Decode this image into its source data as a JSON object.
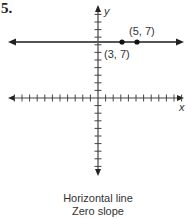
{
  "problem_number": "5.",
  "axes": {
    "x_label": "x",
    "y_label": "y",
    "origin_px": [
      98,
      98
    ],
    "unit_px": 7.6,
    "x_range": [
      -11,
      11
    ],
    "y_range": [
      -11,
      12
    ]
  },
  "line": {
    "type": "horizontal",
    "y_value": 7,
    "color": "#555555"
  },
  "points": [
    {
      "x": 3,
      "y": 7,
      "label": "(3, 7)"
    },
    {
      "x": 5,
      "y": 7,
      "label": "(5, 7)"
    }
  ],
  "caption": {
    "line1": "Horizontal line",
    "line2": "Zero slope"
  },
  "chart_data": {
    "type": "line",
    "title": "Horizontal line",
    "subtitle": "Zero slope",
    "xlabel": "x",
    "ylabel": "y",
    "series": [
      {
        "name": "y = 7",
        "x": [
          3,
          5
        ],
        "y": [
          7,
          7
        ]
      }
    ],
    "annotations": [
      "(3, 7)",
      "(5, 7)"
    ],
    "grid": false,
    "legend": "none"
  }
}
